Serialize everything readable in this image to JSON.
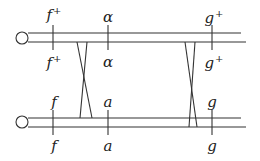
{
  "diagram": {
    "stroke_color": "#333333",
    "strands": [
      {
        "name": "top-strand",
        "labels_above": [
          {
            "base": "f",
            "sup": "+",
            "x": 53
          },
          {
            "base": "α",
            "sup": "",
            "x": 108
          },
          {
            "base": "g",
            "sup": "+",
            "x": 212
          }
        ],
        "labels_below": [
          {
            "base": "f",
            "sup": "+",
            "x": 53
          },
          {
            "base": "α",
            "sup": "",
            "x": 108
          },
          {
            "base": "g",
            "sup": "+",
            "x": 212
          }
        ]
      },
      {
        "name": "bottom-strand",
        "labels_above": [
          {
            "base": "f",
            "sup": "",
            "x": 53
          },
          {
            "base": "a",
            "sup": "",
            "x": 108
          },
          {
            "base": "g",
            "sup": "",
            "x": 212
          }
        ],
        "labels_below": [
          {
            "base": "f",
            "sup": "",
            "x": 53
          },
          {
            "base": "a",
            "sup": "",
            "x": 108
          },
          {
            "base": "g",
            "sup": "",
            "x": 212
          }
        ]
      }
    ]
  }
}
